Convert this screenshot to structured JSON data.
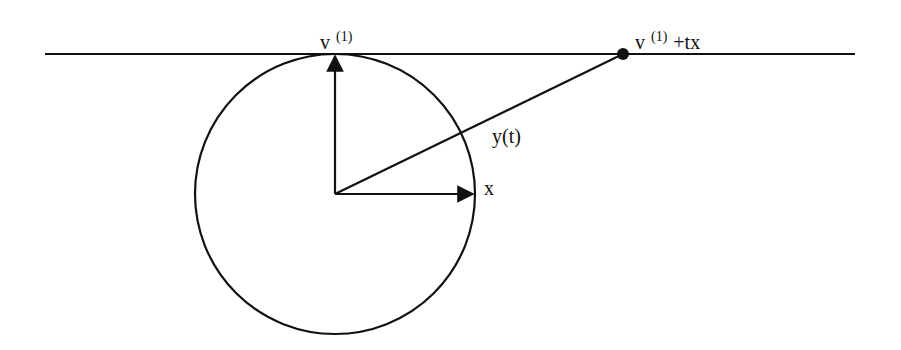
{
  "diagram": {
    "labels": {
      "v1_base": "v",
      "v1_sup": "(1)",
      "point_base": "v",
      "point_sup": "(1)",
      "point_suffix": "+tx",
      "y_t": "y(t)",
      "x": "x"
    },
    "colors": {
      "stroke": "#111111",
      "background": "#ffffff"
    },
    "geometry": {
      "tangent_line": {
        "x1": 45,
        "y1": 54,
        "x2": 855,
        "y2": 54
      },
      "circle": {
        "cx": 335,
        "cy": 194,
        "r": 140
      },
      "vector_v1": {
        "x1": 335,
        "y1": 194,
        "x2": 335,
        "y2": 56
      },
      "vector_x": {
        "x1": 335,
        "y1": 194,
        "x2": 473,
        "y2": 194
      },
      "segment_y": {
        "x1": 335,
        "y1": 194,
        "x2": 623,
        "y2": 54
      },
      "point": {
        "cx": 623,
        "cy": 54,
        "r": 6
      }
    }
  }
}
